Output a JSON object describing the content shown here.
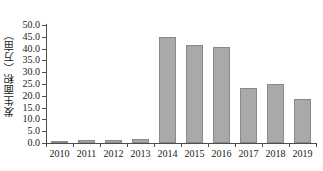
{
  "chart_data": {
    "type": "bar",
    "title": "",
    "xlabel": "",
    "ylabel": "发生面积（万亩）",
    "categories": [
      "2010",
      "2011",
      "2012",
      "2013",
      "2014",
      "2015",
      "2016",
      "2017",
      "2018",
      "2019"
    ],
    "values": [
      1.0,
      1.3,
      1.4,
      1.7,
      45.0,
      41.5,
      40.5,
      23.5,
      25.0,
      18.8
    ],
    "ylim": [
      0.0,
      50.0
    ],
    "ytick_step": 5.0,
    "ytick_labels": [
      "0.0",
      "5.0",
      "10.0",
      "15.0",
      "20.0",
      "25.0",
      "30.0",
      "35.0",
      "40.0",
      "45.0",
      "50.0"
    ],
    "ytick_values": [
      0.0,
      5.0,
      10.0,
      15.0,
      20.0,
      25.0,
      30.0,
      35.0,
      40.0,
      45.0,
      50.0
    ],
    "grid": false,
    "legend": null,
    "bar_color": "#a9a9a9",
    "bar_border_color": "#8a8a8a",
    "axis_color": "#4d4d4d",
    "text_color": "#1a1a1a",
    "background": "#ffffff"
  }
}
